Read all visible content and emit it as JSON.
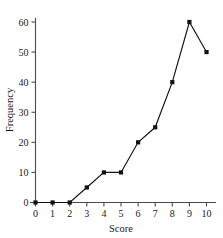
{
  "chart_data": {
    "type": "line",
    "title": "",
    "xlabel": "Score",
    "ylabel": "Frequency",
    "x": [
      0,
      1,
      2,
      3,
      4,
      5,
      6,
      7,
      8,
      9,
      10
    ],
    "values": [
      0,
      0,
      0,
      5,
      10,
      10,
      20,
      25,
      40,
      60,
      50
    ],
    "series": [
      {
        "name": "Frequency",
        "values": [
          0,
          0,
          0,
          5,
          10,
          10,
          20,
          25,
          40,
          60,
          50
        ]
      }
    ],
    "xticklabels": [
      "0",
      "1",
      "2",
      "3",
      "4",
      "5",
      "6",
      "7",
      "8",
      "9",
      "10"
    ],
    "yticklabels": [
      "0",
      "10",
      "20",
      "30",
      "40",
      "50",
      "60"
    ],
    "yticks": [
      0,
      10,
      20,
      30,
      40,
      50,
      60
    ],
    "xlim": [
      0,
      10
    ],
    "ylim": [
      0,
      60
    ],
    "grid": false,
    "legend": false,
    "markers": "filled-square",
    "line_color": "#111111",
    "marker_color": "#111111",
    "axis_color": "#4a4a4a",
    "text_color": "#1a1a1a",
    "background": "#ffffff"
  }
}
